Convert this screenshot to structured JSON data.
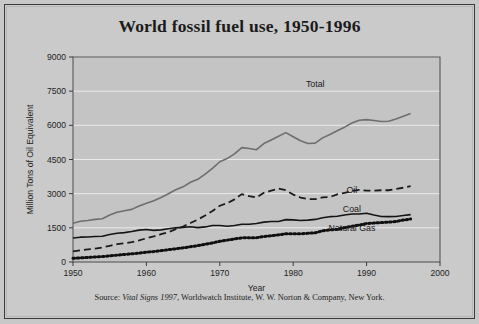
{
  "figure": {
    "title": "World fossil fuel use, 1950-1996",
    "source_prefix": "Source: ",
    "source_italic": "Vital Signs 1997",
    "source_rest": ", Worldwatch Institute, W. W. Norton & Company, New York."
  },
  "chart_data": {
    "type": "line",
    "title": "World fossil fuel use, 1950-1996",
    "xlabel": "Year",
    "ylabel": "Million Tons of Oil Equivalent",
    "xlim": [
      1950,
      2000
    ],
    "ylim": [
      0,
      9000
    ],
    "xticks": [
      1950,
      1960,
      1970,
      1980,
      1990,
      2000
    ],
    "yticks": [
      0,
      1500,
      3000,
      4500,
      6000,
      7500,
      9000
    ],
    "grid": "horizontal",
    "legend": "inline-labels",
    "background": "#cacaca",
    "x": [
      1950,
      1951,
      1952,
      1953,
      1954,
      1955,
      1956,
      1957,
      1958,
      1959,
      1960,
      1961,
      1962,
      1963,
      1964,
      1965,
      1966,
      1967,
      1968,
      1969,
      1970,
      1971,
      1972,
      1973,
      1974,
      1975,
      1976,
      1977,
      1978,
      1979,
      1980,
      1981,
      1982,
      1983,
      1984,
      1985,
      1986,
      1987,
      1988,
      1989,
      1990,
      1991,
      1992,
      1993,
      1994,
      1995,
      1996
    ],
    "series": [
      {
        "name": "Total",
        "color": "#6e6e6e",
        "style": "solid",
        "label_x": 1983,
        "label_y": 7700,
        "values": [
          1715,
          1800,
          1830,
          1880,
          1915,
          2080,
          2200,
          2270,
          2330,
          2470,
          2600,
          2700,
          2840,
          3010,
          3180,
          3320,
          3510,
          3640,
          3870,
          4120,
          4400,
          4540,
          4740,
          5000,
          4960,
          4920,
          5180,
          5340,
          5500,
          5650,
          5480,
          5300,
          5180,
          5200,
          5420,
          5570,
          5720,
          5880,
          6060,
          6170,
          6200,
          6160,
          6120,
          6130,
          6220,
          6330,
          6440
        ],
        "visual_values": [
          1700,
          1790,
          1820,
          1870,
          1900,
          2060,
          2180,
          2250,
          2310,
          2460,
          2580,
          2690,
          2830,
          3000,
          3170,
          3300,
          3500,
          3630,
          3860,
          4110,
          4400,
          4540,
          4750,
          5020,
          4980,
          4930,
          5200,
          5360,
          5520,
          5680,
          5500,
          5320,
          5200,
          5220,
          5450,
          5600,
          5760,
          5920,
          6100,
          6220,
          6250,
          6210,
          6170,
          6180,
          6280,
          6400,
          6520
        ]
      },
      {
        "name": "Oil",
        "color": "#1a1a1a",
        "style": "dashed",
        "label_x": 1988,
        "label_y": 3050,
        "values": [
          470,
          520,
          560,
          600,
          650,
          720,
          790,
          830,
          880,
          960,
          1050,
          1130,
          1230,
          1320,
          1450,
          1570,
          1720,
          1870,
          2050,
          2250,
          2480,
          2590,
          2760,
          2990,
          2900,
          2840,
          3050,
          3140,
          3230,
          3300,
          3100,
          2940,
          2840,
          2820,
          2900,
          2900,
          3020,
          3080,
          3180,
          3230,
          3180,
          3180,
          3200,
          3200,
          3260,
          3310,
          3380
        ],
        "visual_values": [
          470,
          510,
          550,
          590,
          640,
          710,
          780,
          820,
          870,
          950,
          1040,
          1120,
          1220,
          1310,
          1440,
          1560,
          1710,
          1860,
          2040,
          2240,
          2470,
          2580,
          2750,
          2980,
          2890,
          2830,
          3040,
          3130,
          3220,
          3150,
          2960,
          2830,
          2760,
          2760,
          2840,
          2850,
          2970,
          3030,
          3120,
          3170,
          3130,
          3130,
          3150,
          3150,
          3210,
          3260,
          3330
        ]
      },
      {
        "name": "Coal",
        "color": "#141414",
        "style": "solid",
        "label_x": 1988,
        "label_y": 2180,
        "values": [
          1070,
          1110,
          1120,
          1140,
          1150,
          1230,
          1280,
          1310,
          1360,
          1420,
          1450,
          1410,
          1430,
          1480,
          1520,
          1540,
          1570,
          1530,
          1560,
          1620,
          1620,
          1590,
          1620,
          1680,
          1680,
          1710,
          1770,
          1800,
          1800,
          1880,
          1870,
          1840,
          1860,
          1890,
          1960,
          2010,
          2030,
          2080,
          2130,
          2130,
          2160,
          2080,
          2020,
          2010,
          2020,
          2060,
          2100
        ],
        "visual_values": [
          1050,
          1090,
          1100,
          1120,
          1130,
          1210,
          1260,
          1290,
          1340,
          1400,
          1430,
          1390,
          1410,
          1460,
          1500,
          1520,
          1550,
          1510,
          1540,
          1600,
          1600,
          1570,
          1600,
          1660,
          1660,
          1690,
          1750,
          1780,
          1780,
          1860,
          1850,
          1820,
          1840,
          1870,
          1940,
          1990,
          2010,
          2060,
          2110,
          2110,
          2140,
          2060,
          2000,
          1990,
          2000,
          2040,
          2080
        ]
      },
      {
        "name": "Natural Gas",
        "color": "#0f0f0f",
        "style": "dotted",
        "label_x": 1988,
        "label_y": 1350,
        "values": [
          170,
          190,
          210,
          230,
          250,
          280,
          310,
          340,
          370,
          400,
          440,
          470,
          510,
          550,
          590,
          630,
          680,
          730,
          790,
          850,
          920,
          970,
          1020,
          1070,
          1080,
          1080,
          1130,
          1160,
          1200,
          1250,
          1250,
          1250,
          1270,
          1290,
          1380,
          1420,
          1440,
          1520,
          1580,
          1630,
          1700,
          1720,
          1740,
          1760,
          1790,
          1850,
          1900
        ],
        "visual_values": [
          160,
          180,
          200,
          220,
          240,
          270,
          300,
          330,
          360,
          390,
          430,
          460,
          500,
          540,
          580,
          620,
          670,
          720,
          780,
          840,
          910,
          960,
          1010,
          1060,
          1070,
          1070,
          1120,
          1150,
          1190,
          1240,
          1240,
          1240,
          1260,
          1280,
          1370,
          1410,
          1430,
          1510,
          1570,
          1620,
          1690,
          1710,
          1730,
          1750,
          1780,
          1840,
          1890
        ]
      }
    ]
  }
}
